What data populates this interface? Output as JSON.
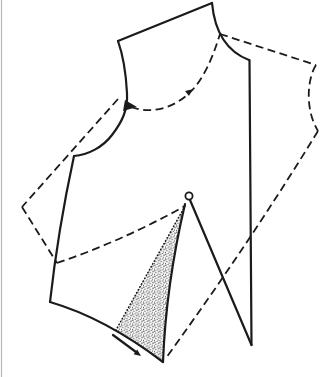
{
  "canvas": {
    "width": 323,
    "height": 377,
    "background": "#ffffff",
    "ink": "#1b1b1b",
    "stipple_dot_color": "#4d4d4d",
    "page_edge_color": "#b5b5b5"
  },
  "diagram": {
    "regions": [
      {
        "name": "dart-spread-stipple-area",
        "d": "M185,206 Q166,285 163,362 Q138,343 116,330 Z",
        "fill": "stipple"
      }
    ],
    "paths": [
      {
        "name": "page-edge-line",
        "d": "M1.5,0 L1.5,377",
        "style": "edge"
      },
      {
        "name": "dashed-shoulder-seam",
        "d": "M220,34 L316,65",
        "style": "dashed"
      },
      {
        "name": "dashed-neckline-curve",
        "d": "M316,65 C307,79 305,110 318,131",
        "style": "dashed"
      },
      {
        "name": "dashed-center-line",
        "d": "M318,131 Q250,242 166,358",
        "style": "dashed"
      },
      {
        "name": "dashed-armhole-curve",
        "d": "M131,107 C150,114 170,109 186,96 C202,83 212,60 220,34",
        "style": "dashed"
      },
      {
        "name": "dashed-side-seam",
        "d": "M118,99 L22,207",
        "style": "dashed"
      },
      {
        "name": "dashed-hem-segment",
        "d": "M22,207 L57,263",
        "style": "dashed"
      },
      {
        "name": "dashed-slash-line",
        "d": "M57,263 Q122,241 185,206",
        "style": "dashed"
      },
      {
        "name": "stipple-edge-dotted-line",
        "d": "M185,206 L116,330",
        "style": "dotted"
      },
      {
        "name": "shoulder-seam",
        "d": "M118,41 L212,3",
        "style": "solid"
      },
      {
        "name": "neckline-curve",
        "d": "M212,3 C215,35 228,52 249,60",
        "style": "solid"
      },
      {
        "name": "center-line",
        "d": "M249.5,60 L251.5,345",
        "style": "solid"
      },
      {
        "name": "pivot-to-center-corner-line",
        "d": "M190,200 L251.5,345",
        "style": "solid"
      },
      {
        "name": "dart-leg-line",
        "d": "M185,204 Q166,285 163,362",
        "style": "solid"
      },
      {
        "name": "hem-curve",
        "d": "M50,302 Q105,318 163,362",
        "style": "solid"
      },
      {
        "name": "side-seam",
        "d": "M50,302 Q58,230 74,156",
        "style": "solid"
      },
      {
        "name": "armhole-curve",
        "d": "M74,156 C88,155 103,147 112,135 C122,122 128,110 127,93 C126,74 123,55 118,41",
        "style": "solid"
      },
      {
        "name": "hem-arrow-shaft",
        "d": "M113,335 L136,352",
        "style": "solid"
      }
    ],
    "markers": [
      {
        "name": "pivot-point-circle",
        "type": "circle",
        "cx": 189,
        "cy": 196,
        "r": 3.6
      },
      {
        "name": "armhole-notch-arrowhead",
        "type": "polygon",
        "points": "125,100 123,111 137,107"
      },
      {
        "name": "pivot-direction-arrowhead",
        "type": "polygon",
        "points": "192.5,89.2 189,96.1 185,91.1"
      },
      {
        "name": "hem-arrowhead",
        "type": "polygon",
        "points": "141,356 133.6,354.2 137.2,349.4"
      }
    ]
  }
}
